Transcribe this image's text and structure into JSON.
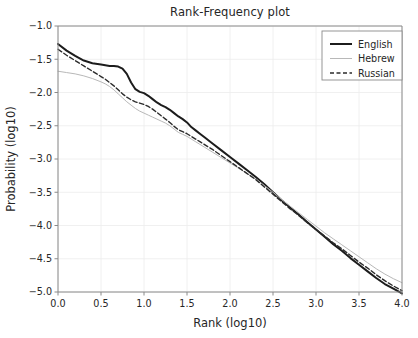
{
  "chart_data": {
    "type": "line",
    "title": "Rank-Frequency plot",
    "xlabel": "Rank (log10)",
    "ylabel": "Probability (log10)",
    "xlim": [
      0.0,
      4.0
    ],
    "ylim": [
      -5.0,
      -1.0
    ],
    "grid": true,
    "legend_position": "upper right",
    "xticks": [
      "0.0",
      "0.5",
      "1.0",
      "1.5",
      "2.0",
      "2.5",
      "3.0",
      "3.5",
      "4.0"
    ],
    "xtick_values": [
      0.0,
      0.5,
      1.0,
      1.5,
      2.0,
      2.5,
      3.0,
      3.5,
      4.0
    ],
    "yticks": [
      "−1.0",
      "−1.5",
      "−2.0",
      "−2.5",
      "−3.0",
      "−3.5",
      "−4.0",
      "−4.5",
      "−5.0"
    ],
    "ytick_values": [
      -1.0,
      -1.5,
      -2.0,
      -2.5,
      -3.0,
      -3.5,
      -4.0,
      -4.5,
      -5.0
    ],
    "x": [
      0.0,
      0.1,
      0.2,
      0.3,
      0.4,
      0.5,
      0.55,
      0.6,
      0.65,
      0.7,
      0.75,
      0.8,
      0.85,
      0.9,
      0.95,
      1.0,
      1.05,
      1.1,
      1.15,
      1.2,
      1.25,
      1.3,
      1.35,
      1.4,
      1.45,
      1.5,
      1.55,
      1.6,
      1.65,
      1.7,
      1.8,
      1.9,
      2.0,
      2.1,
      2.2,
      2.3,
      2.4,
      2.5,
      2.6,
      2.7,
      2.8,
      2.9,
      3.0,
      3.1,
      3.2,
      3.3,
      3.4,
      3.5,
      3.6,
      3.7,
      3.8,
      3.9,
      4.0
    ],
    "series": [
      {
        "name": "English",
        "color": "#1c1c1c",
        "linestyle": "solid",
        "linewidth": 2.0,
        "values": [
          -1.27,
          -1.37,
          -1.45,
          -1.52,
          -1.56,
          -1.58,
          -1.59,
          -1.6,
          -1.6,
          -1.61,
          -1.64,
          -1.72,
          -1.85,
          -1.95,
          -1.99,
          -2.01,
          -2.05,
          -2.1,
          -2.15,
          -2.19,
          -2.22,
          -2.26,
          -2.31,
          -2.36,
          -2.4,
          -2.45,
          -2.52,
          -2.57,
          -2.62,
          -2.67,
          -2.77,
          -2.87,
          -2.97,
          -3.07,
          -3.17,
          -3.27,
          -3.38,
          -3.5,
          -3.62,
          -3.73,
          -3.84,
          -3.95,
          -4.06,
          -4.17,
          -4.28,
          -4.38,
          -4.49,
          -4.59,
          -4.69,
          -4.79,
          -4.88,
          -4.95,
          -5.02
        ]
      },
      {
        "name": "Hebrew",
        "color": "#b8b8b8",
        "linestyle": "solid",
        "linewidth": 1.0,
        "values": [
          -1.68,
          -1.7,
          -1.72,
          -1.75,
          -1.79,
          -1.84,
          -1.87,
          -1.91,
          -1.96,
          -2.02,
          -2.08,
          -2.14,
          -2.19,
          -2.24,
          -2.28,
          -2.31,
          -2.34,
          -2.37,
          -2.4,
          -2.43,
          -2.46,
          -2.5,
          -2.55,
          -2.6,
          -2.63,
          -2.66,
          -2.7,
          -2.74,
          -2.78,
          -2.82,
          -2.9,
          -2.98,
          -3.06,
          -3.14,
          -3.22,
          -3.3,
          -3.4,
          -3.5,
          -3.61,
          -3.71,
          -3.81,
          -3.91,
          -4.01,
          -4.11,
          -4.2,
          -4.29,
          -4.38,
          -4.47,
          -4.56,
          -4.65,
          -4.73,
          -4.8,
          -4.86
        ]
      },
      {
        "name": "Russian",
        "color": "#2b2b2b",
        "linestyle": "dashed",
        "linewidth": 1.4,
        "values": [
          -1.35,
          -1.44,
          -1.52,
          -1.6,
          -1.68,
          -1.76,
          -1.8,
          -1.85,
          -1.9,
          -1.96,
          -2.02,
          -2.07,
          -2.11,
          -2.14,
          -2.16,
          -2.18,
          -2.21,
          -2.25,
          -2.3,
          -2.35,
          -2.4,
          -2.45,
          -2.51,
          -2.56,
          -2.59,
          -2.62,
          -2.66,
          -2.7,
          -2.74,
          -2.78,
          -2.86,
          -2.95,
          -3.04,
          -3.13,
          -3.22,
          -3.31,
          -3.42,
          -3.53,
          -3.64,
          -3.75,
          -3.85,
          -3.96,
          -4.06,
          -4.16,
          -4.26,
          -4.35,
          -4.45,
          -4.55,
          -4.64,
          -4.74,
          -4.83,
          -4.91,
          -4.98
        ]
      }
    ]
  },
  "legend": {
    "entries": [
      {
        "label": "English"
      },
      {
        "label": "Hebrew"
      },
      {
        "label": "Russian"
      }
    ]
  }
}
